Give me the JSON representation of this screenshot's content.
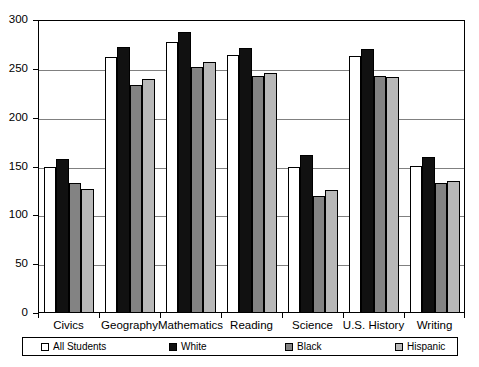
{
  "chart_data": {
    "type": "bar",
    "title": "",
    "subtitle": "",
    "xlabel": "",
    "ylabel": "",
    "ylim": [
      0,
      300
    ],
    "ytick_labels": [
      "0",
      "50",
      "100",
      "150",
      "200",
      "250",
      "300"
    ],
    "yticks": [
      0,
      50,
      100,
      150,
      200,
      250,
      300
    ],
    "grid": true,
    "legend_position": "bottom",
    "categories": [
      "Civics",
      "Geography",
      "Mathematics",
      "Reading",
      "Science",
      "U.S. History",
      "Writing"
    ],
    "series": [
      {
        "name": "All Students",
        "color": "#ffffff",
        "values": [
          150,
          262,
          278,
          264,
          150,
          263,
          151
        ]
      },
      {
        "name": "White",
        "color": "#111111",
        "values": [
          158,
          272,
          288,
          271,
          162,
          270,
          160
        ]
      },
      {
        "name": "Black",
        "color": "#838383",
        "values": [
          133,
          233,
          252,
          243,
          120,
          243,
          133
        ]
      },
      {
        "name": "Hispanic",
        "color": "#b8b8b8",
        "values": [
          127,
          240,
          257,
          246,
          126,
          242,
          135
        ]
      }
    ]
  }
}
